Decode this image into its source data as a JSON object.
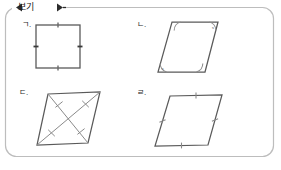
{
  "page": {
    "background_color": "#ffffff",
    "frame_color": "#b9b9b9",
    "ink_color": "#3a3a3a"
  },
  "banner": {
    "label": "보기",
    "left_marker": "◀",
    "right_marker": "▶"
  },
  "figures": [
    {
      "id": "fig-a",
      "label": "ㄱ.",
      "shape": "square",
      "description": "square with single tick mark on each of the four sides",
      "vertices": [
        [
          36,
          25
        ],
        [
          80,
          25
        ],
        [
          80,
          68
        ],
        [
          36,
          68
        ]
      ],
      "side_ticks": 1,
      "diagonals": false,
      "angle_arcs": 0
    },
    {
      "id": "fig-b",
      "label": "ㄴ.",
      "shape": "parallelogram",
      "description": "parallelogram with angle arcs at all four vertices and x labels at two opposite vertices",
      "vertices": [
        [
          172,
          22
        ],
        [
          218,
          22
        ],
        [
          205,
          72
        ],
        [
          158,
          72
        ]
      ],
      "side_ticks": 0,
      "diagonals": false,
      "angle_arcs": 4,
      "angle_labels": [
        "x",
        "x"
      ],
      "angle_label_vertices": [
        1,
        3
      ]
    },
    {
      "id": "fig-c",
      "label": "ㄷ.",
      "shape": "parallelogram",
      "description": "parallelogram with both diagonals drawn and a tick mark on each half diagonal",
      "vertices": [
        [
          48,
          94
        ],
        [
          100,
          92
        ],
        [
          88,
          143
        ],
        [
          37,
          145
        ]
      ],
      "side_ticks": 0,
      "diagonals": true,
      "half_diagonal_ticks": 1,
      "angle_arcs": 0
    },
    {
      "id": "fig-d",
      "label": "ㄹ.",
      "shape": "parallelogram",
      "description": "parallelogram with a single tick mark on each of the four sides",
      "vertices": [
        [
          170,
          96
        ],
        [
          222,
          95
        ],
        [
          208,
          145
        ],
        [
          155,
          146
        ]
      ],
      "side_ticks": 1,
      "diagonals": false,
      "angle_arcs": 0
    }
  ]
}
